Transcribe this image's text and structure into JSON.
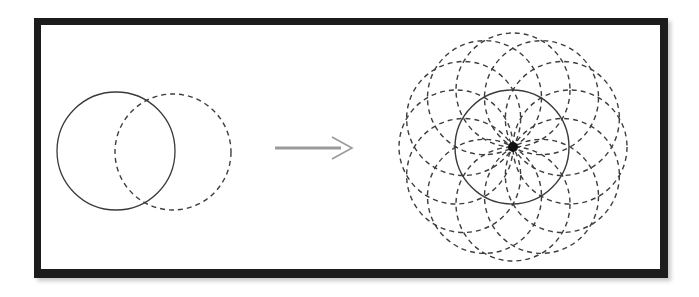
{
  "figure": {
    "title": "Rotation of a circle about a point on another circle",
    "background_color": "#ffffff",
    "frame": {
      "name": "picture-frame",
      "x": 34,
      "y": 18,
      "width": 634,
      "height": 260,
      "border_color": "#1c1c1c",
      "border_width": 8,
      "fill": "#ffffff"
    },
    "stroke_colors": {
      "solid_circle": "#3a3a3a",
      "dashed_circle": "#3d3d3d",
      "center_dot": "#111111",
      "arrow": "#9a9a9a"
    },
    "left_panel": {
      "label": "original pair of circles",
      "solid_circle": {
        "name": "left-solid-circle",
        "cx": 116,
        "cy": 151,
        "r": 59,
        "style": "solid",
        "stroke_width": 1.3
      },
      "dashed_circle": {
        "name": "left-dashed-circle",
        "cx": 173,
        "cy": 152,
        "r": 58,
        "style": "dashed",
        "stroke_width": 1.4,
        "dash_pattern": "5 4"
      },
      "overlap": "lens-shaped intersection region"
    },
    "arrow": {
      "name": "transformation-arrow",
      "x1": 275,
      "y1": 148,
      "x2": 352,
      "y2": 148,
      "head_style": "open-v",
      "head_length": 20,
      "head_half_width": 11,
      "stroke_width": 3,
      "color": "#9a9a9a"
    },
    "right_panel": {
      "label": "rosette of rotated copies",
      "center_point": {
        "name": "rotation-center-dot",
        "cx": 513,
        "cy": 147,
        "r": 5,
        "fill": "#111111"
      },
      "solid_circle": {
        "name": "right-solid-circle",
        "cx": 512,
        "cy": 147,
        "r": 57,
        "style": "solid",
        "stroke_width": 1.4
      },
      "rotated_copies": {
        "name": "rotated-dashed-circles",
        "count": 12,
        "radius": 57,
        "orbit_radius": 57,
        "start_angle_deg": -90,
        "angle_step_deg": 30,
        "style": "dashed",
        "stroke_width": 1.4,
        "dash_pattern": "5 4",
        "centers_deg": [
          -90,
          -60,
          -30,
          0,
          30,
          60,
          90,
          120,
          150,
          180,
          210,
          240
        ]
      }
    }
  },
  "chart_data": {
    "type": "scatter",
    "title": "Rotation of a circle about a point on another circle",
    "xlabel": "",
    "ylabel": "",
    "series": [
      {
        "name": "left-solid-circle",
        "values": [
          116,
          151,
          59
        ]
      },
      {
        "name": "left-dashed-circle",
        "values": [
          173,
          152,
          58
        ]
      },
      {
        "name": "right-solid-circle",
        "values": [
          512,
          147,
          57
        ]
      },
      {
        "name": "rotation-center",
        "values": [
          513,
          147,
          5
        ]
      }
    ]
  }
}
